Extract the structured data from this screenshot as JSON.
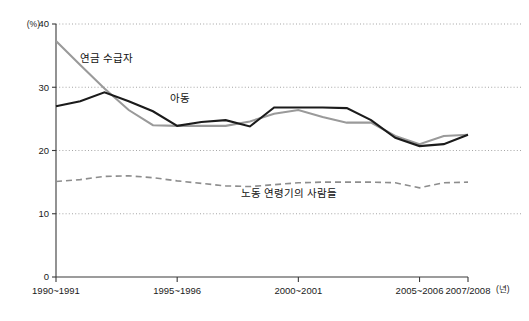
{
  "chart_data": {
    "type": "line",
    "title": "",
    "subtitle": "",
    "xlabel": "(년)",
    "ylabel": "(%)",
    "ylim": [
      0,
      40
    ],
    "y_ticks": [
      0,
      10,
      20,
      30,
      40
    ],
    "y_tick_labels": [
      "0",
      "10",
      "20",
      "30",
      "40"
    ],
    "grid": "horizontal-dotted",
    "legend_position": "inline-annotations",
    "x": [
      "1990~1991",
      "1991~1992",
      "1992~1993",
      "1993~1994",
      "1994~1995",
      "1995~1996",
      "1996~1997",
      "1997~1998",
      "1998~1999",
      "1999~2000",
      "2000~2001",
      "2001~2002",
      "2002~2003",
      "2003~2004",
      "2004~2005",
      "2005~2006",
      "2006~2007",
      "2007/2008"
    ],
    "x_tick_labels": [
      "1990~1991",
      "1995~1996",
      "2000~2001",
      "2005~2006",
      "2007/2008"
    ],
    "x_tick_indices": [
      0,
      5,
      10,
      15,
      17
    ],
    "series": [
      {
        "name": "연금 수급자",
        "style": "solid",
        "color": "#9a9a9a",
        "values": [
          37.3,
          33.5,
          29.8,
          26.4,
          24.0,
          23.9,
          23.9,
          23.9,
          24.6,
          25.8,
          26.4,
          25.3,
          24.4,
          24.4,
          22.3,
          21.0,
          22.3,
          22.5
        ]
      },
      {
        "name": "아동",
        "style": "solid",
        "color": "#1b1b1b",
        "values": [
          27.0,
          27.8,
          29.2,
          27.8,
          26.2,
          23.9,
          24.5,
          24.8,
          23.8,
          26.8,
          26.8,
          26.8,
          26.7,
          24.8,
          22.0,
          20.7,
          21.0,
          22.5
        ]
      },
      {
        "name": "노동 연령기의 사람들",
        "style": "dashed",
        "color": "#8d8d8d",
        "values": [
          15.1,
          15.4,
          15.9,
          16.0,
          15.7,
          15.2,
          14.8,
          14.4,
          14.3,
          14.6,
          14.9,
          15.0,
          15.0,
          15.0,
          14.9,
          14.1,
          14.9,
          15.0
        ]
      }
    ],
    "annotations": [
      {
        "text": "연금 수급자",
        "x_index": 2.1,
        "y_value": 34.0
      },
      {
        "text": "아동",
        "x_index": 5.1,
        "y_value": 27.6
      },
      {
        "text": "노동 연령기의 사람들",
        "x_index": 9.6,
        "y_value": 12.6
      }
    ]
  },
  "axis": {
    "y_unit": "(%)",
    "x_unit": "(년)"
  }
}
